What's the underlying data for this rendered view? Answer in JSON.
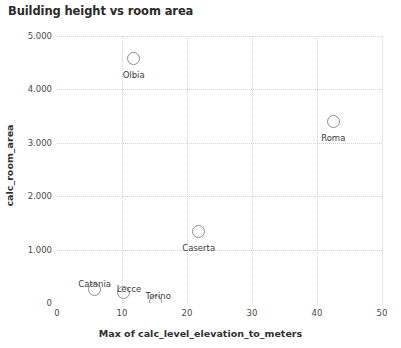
{
  "chart_data": {
    "type": "scatter",
    "title": "Building height vs room area",
    "xlabel": "Max of calc_level_elevation_to_meters",
    "ylabel": "calc_room_area",
    "xlim": [
      0,
      50
    ],
    "ylim": [
      0,
      5000
    ],
    "grid": true,
    "legend": "none",
    "xticks": [
      "0",
      "10",
      "20",
      "30",
      "40",
      "50"
    ],
    "xtick_values": [
      0,
      10,
      20,
      30,
      40,
      50
    ],
    "yticks": [
      "0",
      "1.000",
      "2.000",
      "3.000",
      "4.000",
      "5.000"
    ],
    "ytick_values": [
      0,
      1000,
      2000,
      3000,
      4000,
      5000
    ],
    "points": [
      {
        "label": "Olbia",
        "x": 11.8,
        "y": 4570,
        "label_dx": 0,
        "label_dy": 11
      },
      {
        "label": "Roma",
        "x": 42.5,
        "y": 3390,
        "label_dx": 0,
        "label_dy": 11
      },
      {
        "label": "Caserta",
        "x": 21.8,
        "y": 1330,
        "label_dx": 0,
        "label_dy": 11
      },
      {
        "label": "Catania",
        "x": 5.8,
        "y": 260,
        "label_dx": 0,
        "label_dy": -10
      },
      {
        "label": "Lecce",
        "x": 10.3,
        "y": 190,
        "label_dx": 5,
        "label_dy": -9
      },
      {
        "label": "Torino",
        "x": 15.1,
        "y": 20,
        "label_dx": 3,
        "label_dy": -11
      }
    ],
    "colors": {
      "marker_stroke": "#8d8d8d",
      "gridline": "#d2d2d2",
      "title_text": "#2a2a2a",
      "axis_text": "#4a4a4a",
      "background": "#ffffff"
    }
  }
}
